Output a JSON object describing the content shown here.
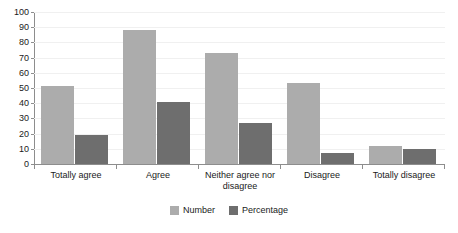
{
  "chart_data": {
    "type": "bar",
    "title": "",
    "subtitle": "",
    "xlabel": "",
    "ylabel": "",
    "ylim": [
      0,
      100
    ],
    "y_ticks": [
      0,
      10,
      20,
      30,
      40,
      50,
      60,
      70,
      80,
      90,
      100
    ],
    "grid": true,
    "legend_position": "bottom",
    "categories": [
      "Totally agree",
      "Agree",
      "Neither agree nor disagree",
      "Disagree",
      "Totally disagree"
    ],
    "series": [
      {
        "name": "Number",
        "color": "#acacac",
        "values": [
          51,
          88,
          73,
          53,
          12
        ]
      },
      {
        "name": "Percentage",
        "color": "#6e6e6e",
        "values": [
          19,
          41,
          27,
          7,
          10
        ]
      }
    ]
  },
  "legend": {
    "items": [
      {
        "label": "Number",
        "color": "#acacac"
      },
      {
        "label": "Percentage",
        "color": "#6e6e6e"
      }
    ]
  },
  "axis": {
    "y_tick_labels": [
      "0",
      "10",
      "20",
      "30",
      "40",
      "50",
      "60",
      "70",
      "80",
      "90",
      "100"
    ]
  },
  "colors": {
    "series_number": "#acacac",
    "series_percentage": "#6e6e6e",
    "axis": "#8d8d8d",
    "gridline": "#f0f0f0",
    "background": "#ffffff",
    "text": "#1a1a1a"
  }
}
